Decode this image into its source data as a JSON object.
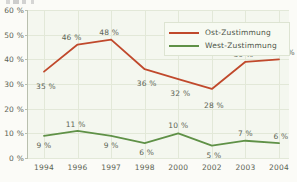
{
  "chart_data": {
    "type": "line",
    "title": "",
    "xlabel": "",
    "ylabel": "",
    "categories": [
      "1994",
      "1996",
      "1997",
      "1998",
      "2000",
      "2002",
      "2003",
      "2004"
    ],
    "ylim": [
      0,
      60
    ],
    "yticks": [
      "0 %",
      "10 %",
      "20 %",
      "30 %",
      "40 %",
      "50 %",
      "60 %"
    ],
    "ytick_values": [
      0,
      10,
      20,
      30,
      40,
      50,
      60
    ],
    "grid": true,
    "legend_position": "top-right",
    "series": [
      {
        "name": "Ost-Zustimmung",
        "color": "#c0492c",
        "values": [
          35,
          46,
          48,
          36,
          32,
          28,
          39,
          40
        ],
        "labels": [
          "35 %",
          "46 %",
          "48 %",
          "36 %",
          "32 %",
          "28 %",
          "39 %",
          "40 %"
        ]
      },
      {
        "name": "West-Zustimmung",
        "color": "#5f9147",
        "values": [
          9,
          11,
          9,
          6,
          10,
          5,
          7,
          6
        ],
        "labels": [
          "9 %",
          "11 %",
          "9 %",
          "6 %",
          "10 %",
          "5 %",
          "7 %",
          "6 %"
        ]
      }
    ]
  },
  "colors": {
    "ost": "#c0492c",
    "west": "#5f9147",
    "plot_background": "#f4f7ef",
    "page_background": "#fbfbf7",
    "grid": "#e2e8d8",
    "axis": "#b9bfae",
    "text": "#5c6454"
  }
}
